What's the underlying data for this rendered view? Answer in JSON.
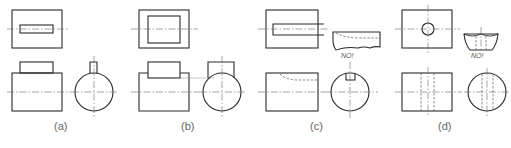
{
  "figure": {
    "panels": [
      {
        "id": "a",
        "label": "(a)"
      },
      {
        "id": "b",
        "label": "(b)"
      },
      {
        "id": "c",
        "label": "(c)",
        "annotation": "NO!"
      },
      {
        "id": "d",
        "label": "(d)",
        "annotation": "NO!"
      }
    ],
    "colors": {
      "line": "#2a2a2a",
      "centerline": "#6a6a6a",
      "label": "#666666"
    }
  }
}
